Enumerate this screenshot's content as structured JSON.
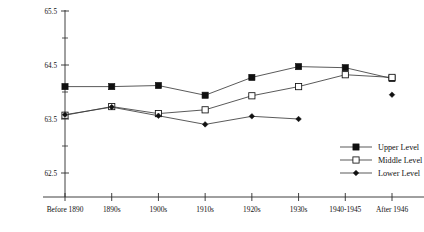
{
  "chart_data": {
    "type": "line",
    "title": "",
    "subtitle": "",
    "xlabel": "",
    "ylabel": "",
    "categories": [
      "Before 1890",
      "1890s",
      "1900s",
      "1910s",
      "1920s",
      "1930s",
      "1940-1945",
      "After 1946"
    ],
    "ylim": [
      62.0,
      65.7
    ],
    "yticks": [
      62.5,
      63.5,
      64.5,
      65.5
    ],
    "ytick_labels": [
      "62.5",
      "63.5",
      "64.5",
      "65.5"
    ],
    "yminor_ticks": [
      63.0,
      64.0,
      65.0
    ],
    "grid": false,
    "legend_position": "bottom-right",
    "series": [
      {
        "name": "Upper Level",
        "marker": "filled-square",
        "values": [
          64.1,
          64.1,
          64.12,
          63.94,
          64.27,
          64.47,
          64.45,
          64.25
        ]
      },
      {
        "name": "Middle Level",
        "marker": "open-square",
        "values": [
          63.57,
          63.73,
          63.6,
          63.67,
          63.93,
          64.1,
          64.32,
          64.27
        ]
      },
      {
        "name": "Lower Level",
        "marker": "filled-diamond",
        "values": [
          63.58,
          63.72,
          63.56,
          63.4,
          63.55,
          63.5,
          null,
          63.95
        ]
      }
    ]
  },
  "legend": {
    "entries": [
      {
        "label": "Upper Level"
      },
      {
        "label": "Middle Level"
      },
      {
        "label": "Lower Level"
      }
    ]
  }
}
